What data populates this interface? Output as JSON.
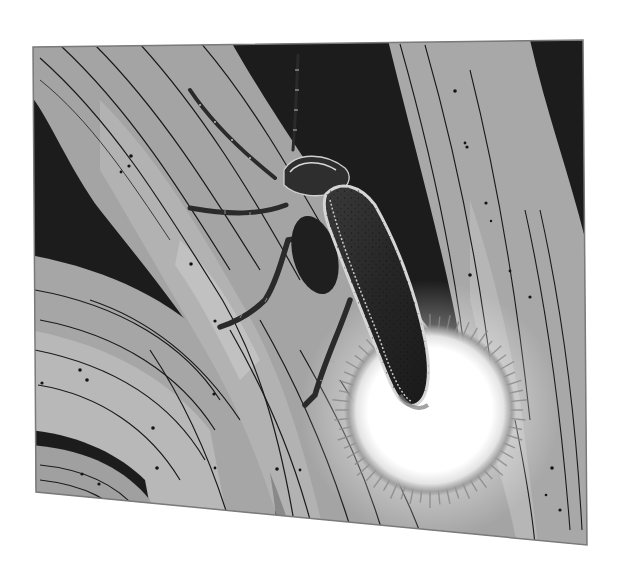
{
  "illustration": {
    "caption": "Firefly on a blade of grass at night, abdomen glowing",
    "style": "grayscale manga screentone",
    "panel": {
      "corners": {
        "tl": [
          33,
          47
        ],
        "tr": [
          583,
          40
        ],
        "br": [
          587,
          545
        ],
        "bl": [
          36,
          492
        ]
      },
      "border_color": "#7a7a7a"
    },
    "colors": {
      "page_bg": "#ffffff",
      "night_bg": "#1c1c1c",
      "blade_mid": "#a8a8a8",
      "blade_light": "#c6c6c6",
      "blade_shadow": "#8c8c8c",
      "ink": "#1a1a1a",
      "beetle_body": "#2a2a2a",
      "beetle_highlight": "#cfcfcf",
      "glow_core": "#ffffff",
      "glow_rim": "#8a8a8a"
    },
    "subjects": [
      {
        "name": "firefly",
        "parts": [
          "antenna",
          "head",
          "pronotum",
          "elytra",
          "front-leg",
          "middle-leg",
          "hind-leg",
          "glowing-abdomen"
        ]
      },
      {
        "name": "main-grass-blade",
        "direction": "diagonal top-left to bottom-right"
      },
      {
        "name": "right-grass-blade",
        "direction": "curving down right side"
      },
      {
        "name": "lower-left-grass-blades",
        "direction": "sweeping curves"
      }
    ],
    "glow": {
      "center": [
        430,
        410
      ],
      "radius": 90
    }
  }
}
